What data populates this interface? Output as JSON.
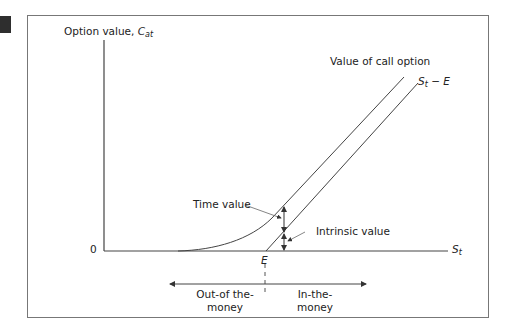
{
  "diagram": {
    "y_axis_label": "Option value, ",
    "y_axis_symbol": "C",
    "y_axis_subscript": "at",
    "origin_label": "0",
    "x_axis_symbol": "S",
    "x_axis_subscript": "t",
    "strike_label": "E",
    "curve_label": "Value of call option",
    "line_label_symbol": "S",
    "line_label_subscript": "t",
    "line_label_rest": " − E",
    "time_value_label": "Time value",
    "intrinsic_value_label": "Intrinsic value",
    "out_of_money_line1": "Out-of the-",
    "out_of_money_line2": "money",
    "in_money_line1": "In-the-",
    "in_money_line2": "money"
  },
  "colors": {
    "line": "#444444",
    "frame": "#777777",
    "text": "#222222"
  }
}
